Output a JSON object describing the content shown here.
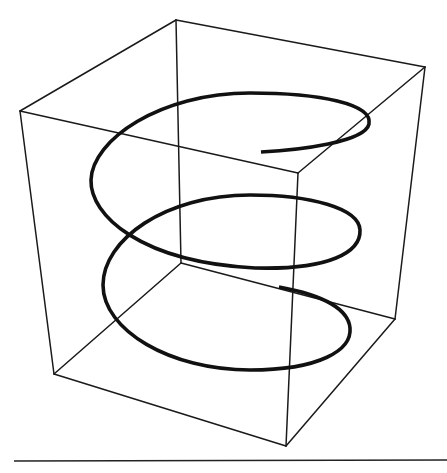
{
  "figure": {
    "colors": {
      "background": "#ffffff",
      "box_edge": "#1a1a1a",
      "helix": "#111111",
      "rule": "#222222"
    },
    "box": {
      "corners": {
        "top_back_left": [
          176,
          20
        ],
        "top_back_right": [
          425,
          67
        ],
        "top_front_left": [
          20,
          111
        ],
        "top_front_right": [
          298,
          173
        ],
        "bottom_back_left": [
          181,
          263
        ],
        "bottom_back_right": [
          395,
          319
        ],
        "bottom_front_left": [
          54,
          374
        ],
        "bottom_front_right": [
          286,
          446
        ]
      }
    },
    "helix": {
      "turns": 3,
      "path": "M 261 152 C 300 150, 365 142, 369 124 C 373 104, 320 93, 250 93 C 160 93, 92 140, 91 180 C 90 215, 140 262, 255 268 C 330 270, 361 252, 360 230 C 359 208, 310 195, 250 195 C 165 195, 103 240, 103 285 C 103 330, 170 370, 250 370 C 320 370, 352 350, 350 328 C 348 305, 312 293, 279 287"
    },
    "baseline_rule": {
      "x1": 14,
      "y1": 461,
      "x2": 447,
      "y2": 460
    }
  }
}
